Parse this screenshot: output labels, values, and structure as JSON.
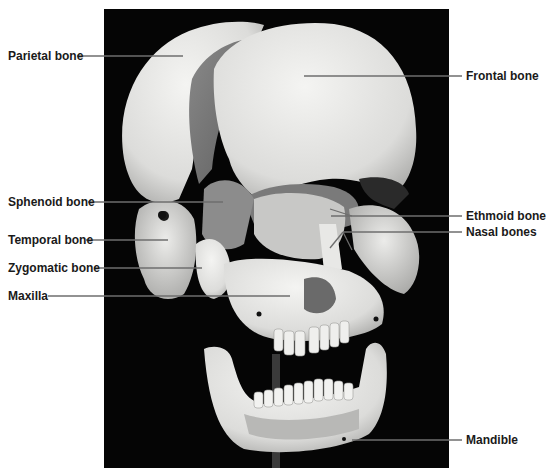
{
  "figure": {
    "background": "#ffffff",
    "photo_background": "#050505",
    "leader_color": "#6e6e6e",
    "label_color": "#1a1a1a"
  },
  "labels": {
    "left": [
      {
        "text": "Parietal bone",
        "x": 8,
        "y": 49,
        "line": {
          "x1": 77,
          "y1": 56,
          "x2": 183,
          "y2": 56
        }
      },
      {
        "text": "Sphenoid bone",
        "x": 8,
        "y": 195,
        "line": {
          "x1": 88,
          "y1": 202,
          "x2": 223,
          "y2": 202
        }
      },
      {
        "text": "Temporal bone",
        "x": 8,
        "y": 233,
        "line": {
          "x1": 86,
          "y1": 240,
          "x2": 168,
          "y2": 240
        }
      },
      {
        "text": "Zygomatic bone",
        "x": 8,
        "y": 261,
        "line": {
          "x1": 94,
          "y1": 268,
          "x2": 202,
          "y2": 268
        }
      },
      {
        "text": "Maxilla",
        "x": 8,
        "y": 289,
        "line": {
          "x1": 48,
          "y1": 296,
          "x2": 290,
          "y2": 296
        }
      }
    ],
    "right": [
      {
        "text": "Frontal bone",
        "x": 466,
        "y": 69,
        "line": {
          "x1": 304,
          "y1": 76,
          "x2": 462,
          "y2": 76
        }
      },
      {
        "text": "Ethmoid bone",
        "x": 466,
        "y": 209,
        "line": {
          "x1": 331,
          "y1": 216,
          "x2": 462,
          "y2": 216
        },
        "tick": {
          "x1": 330,
          "y1": 209,
          "x2": 352,
          "y2": 216
        }
      },
      {
        "text": "Nasal bones",
        "x": 466,
        "y": 225,
        "line": {
          "x1": 343,
          "y1": 232,
          "x2": 462,
          "y2": 232
        },
        "fork": [
          {
            "x1": 343,
            "y1": 232,
            "x2": 330,
            "y2": 248
          },
          {
            "x1": 343,
            "y1": 232,
            "x2": 352,
            "y2": 250
          }
        ]
      },
      {
        "text": "Mandible",
        "x": 466,
        "y": 433,
        "line": {
          "x1": 352,
          "y1": 440,
          "x2": 462,
          "y2": 440
        }
      }
    ]
  }
}
